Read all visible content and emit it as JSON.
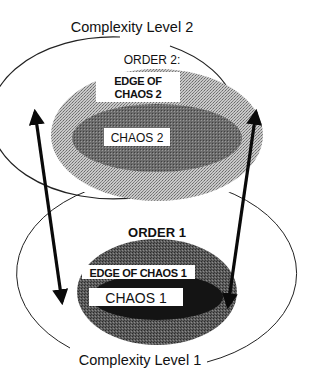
{
  "diagram": {
    "level2": {
      "title": "Complexity Level 2",
      "order_label": "ORDER 2:",
      "edge_label_line1": "EDGE OF",
      "edge_label_line2": "CHAOS 2",
      "chaos_label": "CHAOS 2"
    },
    "level1": {
      "title": "Complexity Level 1",
      "order_label": "ORDER 1",
      "edge_label": "EDGE OF CHAOS 1",
      "chaos_label": "CHAOS 1"
    },
    "colors": {
      "outline": "#222222",
      "edge_of_chaos_2": "#b5b5b5",
      "chaos_2": "#555555",
      "edge_of_chaos_1": "#5a5a5a",
      "chaos_1": "#141414",
      "arrow": "#0a0a0a",
      "label_box": "#ffffff"
    },
    "arrows": [
      {
        "name": "left-double-arrow",
        "from": "Complexity Level 1",
        "to": "Complexity Level 2"
      },
      {
        "name": "right-double-arrow",
        "from": "Complexity Level 1",
        "to": "Complexity Level 2"
      }
    ]
  }
}
